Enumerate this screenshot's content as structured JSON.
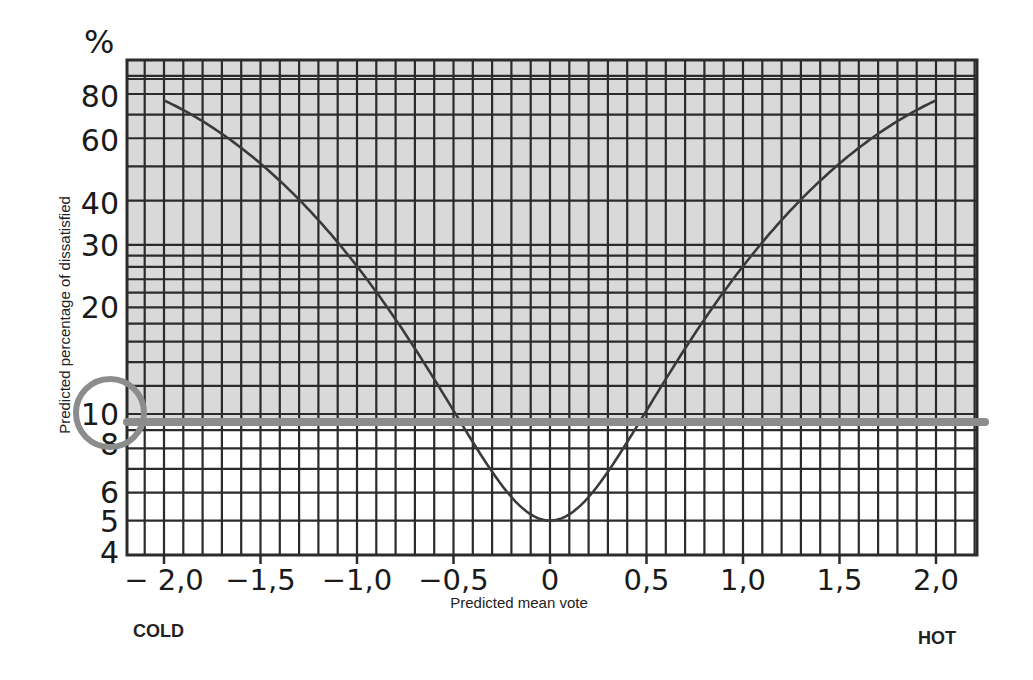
{
  "chart_data": {
    "type": "line",
    "title": "",
    "xlabel": "Predicted mean vote",
    "ylabel": "Predicted percentage of dissatisfied",
    "y_unit": "%",
    "y_scale": "log",
    "xlim": [
      -2.2,
      2.2
    ],
    "ylim": [
      4,
      100
    ],
    "grid": true,
    "x_ticks": [
      -2.0,
      -1.5,
      -1.0,
      -0.5,
      0,
      0.5,
      1.0,
      1.5,
      2.0
    ],
    "x_tick_labels": [
      "− 2,0",
      "−1,5",
      "−1,0",
      "−0,5",
      "0",
      "0,5",
      "1,0",
      "1,5",
      "2,0"
    ],
    "y_ticks": [
      4,
      5,
      6,
      8,
      10,
      20,
      30,
      40,
      60,
      80
    ],
    "y_tick_labels": [
      "4",
      "5",
      "6",
      "8",
      "10",
      "20",
      "30",
      "40",
      "60",
      "80"
    ],
    "end_labels": {
      "left": "COLD",
      "right": "HOT"
    },
    "series": [
      {
        "name": "PPD",
        "x": [
          -2.0,
          -1.8,
          -1.6,
          -1.5,
          -1.4,
          -1.2,
          -1.0,
          -0.8,
          -0.6,
          -0.5,
          -0.4,
          -0.3,
          -0.2,
          -0.1,
          0,
          0.1,
          0.2,
          0.3,
          0.4,
          0.5,
          0.6,
          0.8,
          1.0,
          1.2,
          1.4,
          1.5,
          1.6,
          1.8,
          2.0
        ],
        "values": [
          76.8,
          67.1,
          56.0,
          50.4,
          44.8,
          34.5,
          26.1,
          18.6,
          12.5,
          10.2,
          8.3,
          6.9,
          5.8,
          5.2,
          5.0,
          5.2,
          5.8,
          6.9,
          8.3,
          10.2,
          12.5,
          18.6,
          26.1,
          34.5,
          44.8,
          50.4,
          56.0,
          67.1,
          76.8
        ]
      }
    ],
    "annotations": [
      {
        "type": "hline",
        "y": 10,
        "label": "10% threshold",
        "color": "#8c8c8c"
      },
      {
        "type": "circle",
        "around": "y-tick 10",
        "color": "#8c8c8c"
      }
    ],
    "colors": {
      "upper_band": "#d9d9d9",
      "lower_band": "#ffffff",
      "grid": "#2b2b2b",
      "curve": "#3a3a3a",
      "highlight": "#8c8c8c"
    }
  }
}
